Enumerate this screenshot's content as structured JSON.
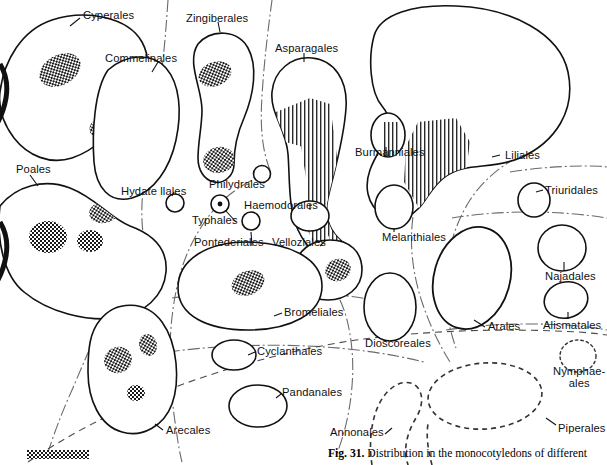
{
  "figure": {
    "number": "Fig. 31.",
    "caption_text": " Distribution in the monocotyledons of different",
    "legend_swatch_name": "checkered-stipple-swatch"
  },
  "diagram": {
    "title": "Distribution in the monocotyledons of different",
    "style": {
      "outline_color": "#111111",
      "fill_color": "#ffffff",
      "stipple_color": "#1a1a1a",
      "hatch_color": "#2a2a2a",
      "boundary_color": "#555555",
      "background": "#ffffff"
    },
    "taxa": [
      {
        "id": "cyperales",
        "label": "Cyperales",
        "label_x": 83,
        "label_y": 9,
        "outline": "solid",
        "fill": "stipple"
      },
      {
        "id": "commelinales",
        "label": "Commelinales",
        "label_x": 105,
        "label_y": 52,
        "outline": "solid",
        "fill": "stipple"
      },
      {
        "id": "zingiberales",
        "label": "Zingiberales",
        "label_x": 186,
        "label_y": 12,
        "outline": "solid",
        "fill": "stipple"
      },
      {
        "id": "asparagales",
        "label": "Asparagales",
        "label_x": 280,
        "label_y": 44,
        "outline": "solid",
        "fill": "hatch"
      },
      {
        "id": "liliales",
        "label": "Liliales",
        "label_x": 505,
        "label_y": 149,
        "outline": "solid",
        "fill": "hatch"
      },
      {
        "id": "burmanniales",
        "label": "Burmanniales",
        "label_x": 358,
        "label_y": 148,
        "outline": "solid",
        "fill": "hatch"
      },
      {
        "id": "melanthiales",
        "label": "Melanthiales",
        "label_x": 385,
        "label_y": 232,
        "outline": "solid",
        "fill": "none"
      },
      {
        "id": "poales",
        "label": "Poales",
        "label_x": 17,
        "label_y": 165,
        "outline": "solid",
        "fill": "stipple"
      },
      {
        "id": "hydatellales",
        "label": "Hydate llales",
        "label_x": 122,
        "label_y": 187,
        "outline": "solid",
        "fill": "none"
      },
      {
        "id": "philydrales",
        "label": "Philydrales",
        "label_x": 210,
        "label_y": 179,
        "outline": "solid",
        "fill": "none"
      },
      {
        "id": "typhales",
        "label": "Typhales",
        "label_x": 194,
        "label_y": 216,
        "outline": "solid",
        "fill": "dot"
      },
      {
        "id": "haemodorales",
        "label": "Haemodorales",
        "label_x": 245,
        "label_y": 202,
        "outline": "solid",
        "fill": "none"
      },
      {
        "id": "pontederiales",
        "label": "Pontederiales",
        "label_x": 196,
        "label_y": 237,
        "outline": "solid",
        "fill": "none"
      },
      {
        "id": "velloziales",
        "label": "Velloziales",
        "label_x": 274,
        "label_y": 237,
        "outline": "solid",
        "fill": "stipple"
      },
      {
        "id": "bromeliales",
        "label": "Bromeliales",
        "label_x": 285,
        "label_y": 309,
        "outline": "solid",
        "fill": "stipple"
      },
      {
        "id": "cyclanthales",
        "label": "Cyclanthales",
        "label_x": 257,
        "label_y": 347,
        "outline": "solid",
        "fill": "none"
      },
      {
        "id": "pandanales",
        "label": "Pandanales",
        "label_x": 283,
        "label_y": 388,
        "outline": "solid",
        "fill": "none"
      },
      {
        "id": "arecales",
        "label": "Arecales",
        "label_x": 165,
        "label_y": 426,
        "outline": "solid",
        "fill": "stipple"
      },
      {
        "id": "dioscoreales",
        "label": "Dioscoreales",
        "label_x": 367,
        "label_y": 340,
        "outline": "solid",
        "fill": "none"
      },
      {
        "id": "arales",
        "label": "Arales",
        "label_x": 489,
        "label_y": 322,
        "outline": "solid",
        "fill": "none"
      },
      {
        "id": "triuridales",
        "label": "Triuridales",
        "label_x": 546,
        "label_y": 186,
        "outline": "solid",
        "fill": "none"
      },
      {
        "id": "najadales",
        "label": "Najadales",
        "label_x": 546,
        "label_y": 272,
        "outline": "solid",
        "fill": "none"
      },
      {
        "id": "alismatales",
        "label": "Alismatales",
        "label_x": 544,
        "label_y": 321,
        "outline": "solid",
        "fill": "none"
      },
      {
        "id": "nymphaeales",
        "label": "Nymphae-\nales",
        "label_x": 557,
        "label_y": 369,
        "outline": "dotted",
        "fill": "none"
      },
      {
        "id": "piperales",
        "label": "Piperales",
        "label_x": 558,
        "label_y": 425,
        "outline": "dashed",
        "fill": "none"
      },
      {
        "id": "annonales",
        "label": "Annonales",
        "label_x": 330,
        "label_y": 428,
        "outline": "dashed",
        "fill": "none"
      }
    ]
  }
}
